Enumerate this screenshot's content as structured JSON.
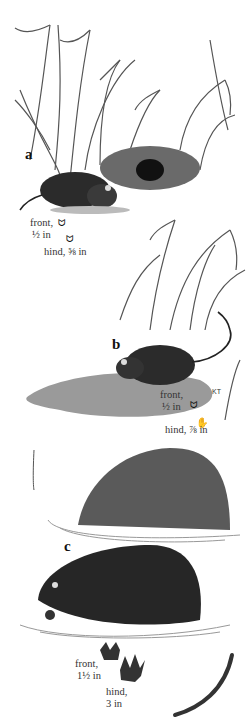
{
  "figure": {
    "panels": [
      {
        "label": "a",
        "subject": "small vole with grass nest",
        "tracks": {
          "front": "front,",
          "front_size": "½ in",
          "hind": "hind, ⅝ in"
        }
      },
      {
        "label": "b",
        "subject": "rat-like rodent on mud bank with long tail",
        "tracks": {
          "front": "front,",
          "front_size": "½ in",
          "hind": "hind, ⅞ in"
        },
        "signature": "KT"
      },
      {
        "label": "c",
        "subject": "muskrat swimming near lodge",
        "tracks": {
          "front": "front,",
          "front_size": "1½ in",
          "hind": "hind,",
          "hind_size": "3 in"
        }
      }
    ],
    "colors": {
      "ink": "#1a1a1a",
      "fur": "#2b2b2b",
      "grass": "#555555",
      "water": "#999999",
      "background": "#ffffff"
    }
  }
}
